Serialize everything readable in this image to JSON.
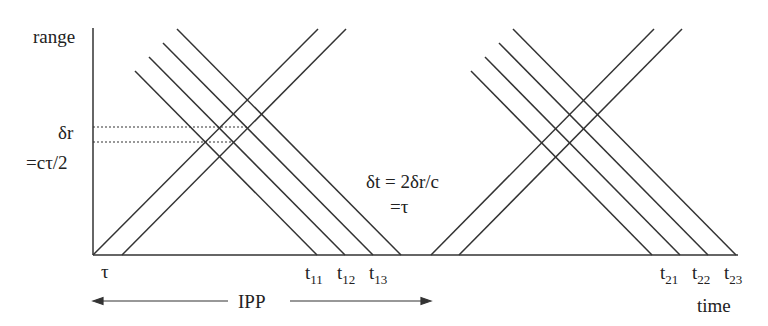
{
  "axes": {
    "y_label": "range",
    "x_label": "time"
  },
  "annotations": {
    "delta_r": "δr",
    "delta_r_eq": "=cτ/2",
    "delta_t": "δt = 2δr/c",
    "delta_t_eq": "=τ",
    "tau": "τ",
    "ipp": "IPP"
  },
  "ticks": {
    "t11": {
      "base": "t",
      "sub": "11"
    },
    "t12": {
      "base": "t",
      "sub": "12"
    },
    "t13": {
      "base": "t",
      "sub": "13"
    },
    "t21": {
      "base": "t",
      "sub": "21"
    },
    "t22": {
      "base": "t",
      "sub": "22"
    },
    "t23": {
      "base": "t",
      "sub": "23"
    }
  },
  "colors": {
    "line": "#333333",
    "background": "#ffffff"
  }
}
